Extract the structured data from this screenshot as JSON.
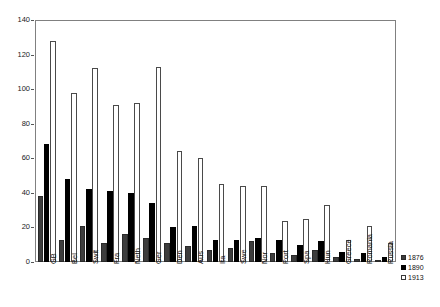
{
  "chart_data": {
    "type": "bar",
    "title": "",
    "xlabel": "",
    "ylabel": "",
    "ylim": [
      0,
      140
    ],
    "yticks": [
      0,
      20,
      40,
      60,
      80,
      100,
      120,
      140
    ],
    "grid": false,
    "legend_position": "bottom-right",
    "categories": [
      "GB",
      "Bel",
      "Swit",
      "Fra",
      "Neth",
      "Ger",
      "Den",
      "Aus",
      "Ita",
      "Swe",
      "Nor",
      "Port",
      "Spa",
      "Hun",
      "Greece",
      "Romania",
      "Russia"
    ],
    "series": [
      {
        "name": "1876",
        "color": "#3d3d3d",
        "values": [
          38,
          13,
          21,
          11,
          16,
          14,
          11,
          9,
          7,
          8,
          12,
          5,
          4,
          7,
          3,
          2,
          1
        ]
      },
      {
        "name": "1890",
        "color": "#000000",
        "values": [
          68,
          48,
          42,
          41,
          40,
          34,
          20,
          21,
          13,
          13,
          14,
          13,
          10,
          12,
          6,
          5,
          3
        ]
      },
      {
        "name": "1913",
        "color": "#ffffff",
        "values": [
          128,
          98,
          112,
          91,
          92,
          113,
          64,
          60,
          45,
          44,
          44,
          24,
          25,
          33,
          13,
          21,
          11
        ]
      }
    ]
  },
  "legend": {
    "items": [
      {
        "label": "1876",
        "key": "y1876"
      },
      {
        "label": "1890",
        "key": "y1890"
      },
      {
        "label": "1913",
        "key": "y1913"
      }
    ]
  }
}
